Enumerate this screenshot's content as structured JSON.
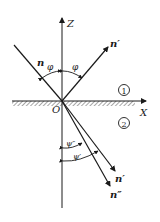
{
  "diagram": {
    "type": "reflection-refraction",
    "colors": {
      "line": "#1a1a1a",
      "hatch": "#6a6a6a",
      "background": "#ffffff"
    },
    "axes": {
      "z_label": "Z",
      "x_label": "X",
      "origin_label": "O"
    },
    "media": {
      "upper": "①",
      "lower": "②"
    },
    "rays": {
      "incident": "n",
      "reflected": "n′",
      "refracted_1": "n′",
      "refracted_2": "n″"
    },
    "angles": {
      "incidence": "φ",
      "reflection": "φ",
      "refraction_1": "ψ″",
      "refraction_2": "ψ′"
    }
  }
}
